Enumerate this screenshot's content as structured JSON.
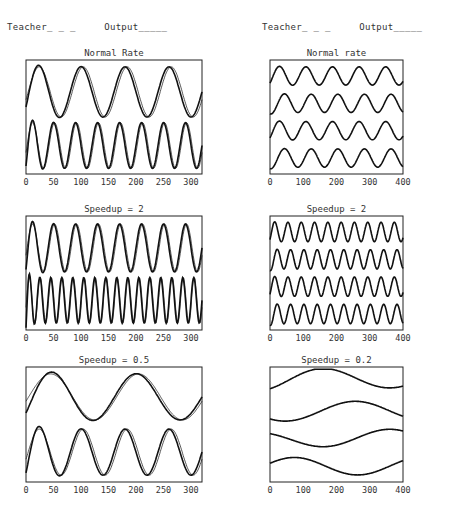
{
  "header": {
    "left": "Teacher_ _ _     Output_____",
    "right": "Teacher_ _ _     Output_____"
  },
  "chart_data": [
    {
      "type": "line",
      "column": "left",
      "title": "Normal Rate",
      "xlim": [
        0,
        320
      ],
      "xticks": [
        0,
        50,
        100,
        150,
        200,
        250,
        300
      ],
      "tick_labels": [
        "0",
        "50",
        "100",
        "150",
        "200",
        "250",
        "300"
      ],
      "traces": [
        {
          "name": "teacher-1",
          "style": "thin",
          "period": 80,
          "phase": 0.05,
          "offset": 0.28,
          "amp": 0.22,
          "transient": 0
        },
        {
          "name": "output-1",
          "style": "thick",
          "period": 80,
          "phase": 0.0,
          "offset": 0.28,
          "amp": 0.22,
          "transient": 0.6
        },
        {
          "name": "teacher-2",
          "style": "thin",
          "period": 40,
          "phase": 0.05,
          "offset": 0.75,
          "amp": 0.2,
          "transient": 0
        },
        {
          "name": "output-2",
          "style": "thick",
          "period": 40,
          "phase": 0.0,
          "offset": 0.75,
          "amp": 0.2,
          "transient": 0.9
        }
      ]
    },
    {
      "type": "line",
      "column": "right",
      "title": "Normal rate",
      "xlim": [
        0,
        400
      ],
      "xticks": [
        0,
        100,
        200,
        300,
        400
      ],
      "tick_labels": [
        "0",
        "100",
        "200",
        "300",
        "400"
      ],
      "traces": [
        {
          "name": "series-1",
          "style": "thick",
          "period": 80,
          "phase": 0.1,
          "offset": 0.14,
          "amp": 0.08,
          "transient": 0.2
        },
        {
          "name": "series-2",
          "style": "thick",
          "period": 80,
          "phase": 0.3,
          "offset": 0.38,
          "amp": 0.08,
          "transient": 0.2
        },
        {
          "name": "series-3",
          "style": "thick",
          "period": 80,
          "phase": 0.1,
          "offset": 0.62,
          "amp": 0.08,
          "transient": 0.2
        },
        {
          "name": "series-4",
          "style": "thick",
          "period": 80,
          "phase": 0.3,
          "offset": 0.86,
          "amp": 0.08,
          "transient": 0.2
        }
      ]
    },
    {
      "type": "line",
      "column": "left",
      "title": "Speedup = 2",
      "xlim": [
        0,
        320
      ],
      "xticks": [
        0,
        50,
        100,
        150,
        200,
        250,
        300
      ],
      "tick_labels": [
        "0",
        "50",
        "100",
        "150",
        "200",
        "250",
        "300"
      ],
      "traces": [
        {
          "name": "teacher-1",
          "style": "thin",
          "period": 40,
          "phase": 0.05,
          "offset": 0.28,
          "amp": 0.21,
          "transient": 0
        },
        {
          "name": "output-1",
          "style": "thick",
          "period": 40,
          "phase": 0.0,
          "offset": 0.28,
          "amp": 0.21,
          "transient": 0.9
        },
        {
          "name": "teacher-2",
          "style": "thin",
          "period": 20,
          "phase": 0.05,
          "offset": 0.74,
          "amp": 0.2,
          "transient": 0
        },
        {
          "name": "output-2",
          "style": "thick",
          "period": 20,
          "phase": 0.0,
          "offset": 0.74,
          "amp": 0.2,
          "transient": 1.2
        }
      ]
    },
    {
      "type": "line",
      "column": "right",
      "title": "Speedup = 2",
      "xlim": [
        0,
        400
      ],
      "xticks": [
        0,
        100,
        200,
        300,
        400
      ],
      "tick_labels": [
        "0",
        "100",
        "200",
        "300",
        "400"
      ],
      "traces": [
        {
          "name": "series-1",
          "style": "thick",
          "period": 40,
          "phase": 0.1,
          "offset": 0.14,
          "amp": 0.085,
          "transient": 0.2
        },
        {
          "name": "series-2",
          "style": "thick",
          "period": 40,
          "phase": 0.3,
          "offset": 0.38,
          "amp": 0.085,
          "transient": 0.2
        },
        {
          "name": "series-3",
          "style": "thick",
          "period": 40,
          "phase": 0.1,
          "offset": 0.62,
          "amp": 0.085,
          "transient": 0.2
        },
        {
          "name": "series-4",
          "style": "thick",
          "period": 40,
          "phase": 0.3,
          "offset": 0.86,
          "amp": 0.085,
          "transient": 0.2
        }
      ]
    },
    {
      "type": "line",
      "column": "left",
      "title": "Speedup = 0.5",
      "xlim": [
        0,
        320
      ],
      "xticks": [
        0,
        50,
        100,
        150,
        200,
        250,
        300
      ],
      "tick_labels": [
        "0",
        "50",
        "100",
        "150",
        "200",
        "250",
        "300"
      ],
      "traces": [
        {
          "name": "teacher-1",
          "style": "thin",
          "period": 160,
          "phase": 0.03,
          "offset": 0.26,
          "amp": 0.2,
          "transient": 0
        },
        {
          "name": "output-1",
          "style": "thick",
          "period": 160,
          "phase": 0.0,
          "offset": 0.26,
          "amp": 0.2,
          "transient": 0.7
        },
        {
          "name": "teacher-2",
          "style": "thin",
          "period": 80,
          "phase": 0.05,
          "offset": 0.74,
          "amp": 0.2,
          "transient": 0
        },
        {
          "name": "output-2",
          "style": "thick",
          "period": 80,
          "phase": 0.0,
          "offset": 0.74,
          "amp": 0.2,
          "transient": 0.9
        }
      ]
    },
    {
      "type": "line",
      "column": "right",
      "title": "Speedup = 0.2",
      "xlim": [
        0,
        400
      ],
      "xticks": [
        0,
        100,
        200,
        300,
        400
      ],
      "tick_labels": [
        "0",
        "100",
        "200",
        "300",
        "400"
      ],
      "traces": [
        {
          "name": "series-1",
          "style": "thick",
          "period": 400,
          "phase": 0.15,
          "offset": 0.1,
          "amp": 0.08,
          "transient": 0.3
        },
        {
          "name": "series-2",
          "style": "thick",
          "period": 400,
          "phase": 0.4,
          "offset": 0.38,
          "amp": 0.08,
          "transient": 0.3
        },
        {
          "name": "series-3",
          "style": "thick",
          "period": 400,
          "phase": 0.65,
          "offset": 0.62,
          "amp": 0.08,
          "transient": 0.3
        },
        {
          "name": "series-4",
          "style": "thick",
          "period": 400,
          "phase": 0.9,
          "offset": 0.86,
          "amp": 0.08,
          "transient": 0.3
        }
      ]
    }
  ]
}
